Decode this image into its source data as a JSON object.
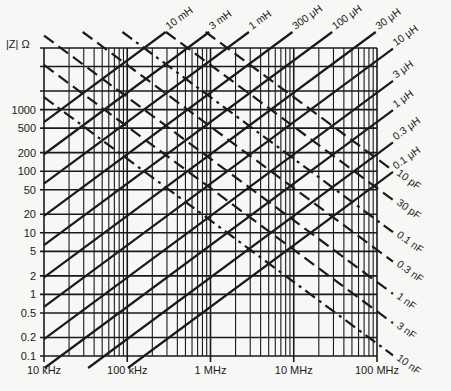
{
  "chart_data": {
    "type": "line",
    "title": "",
    "xlabel": "",
    "ylabel": "|Z| Ω",
    "xscale": "log",
    "yscale": "log",
    "xlim_hz": [
      10000,
      100000000
    ],
    "ylim_ohm": [
      0.1,
      10000
    ],
    "grid": true,
    "x_ticks": [
      {
        "value": 10000,
        "label": "10 kHz"
      },
      {
        "value": 100000,
        "label": "100 kHz"
      },
      {
        "value": 1000000,
        "label": "1 MHz"
      },
      {
        "value": 10000000,
        "label": "10 MHz"
      },
      {
        "value": 100000000,
        "label": "100 MHz"
      }
    ],
    "y_ticks": [
      {
        "value": 1000,
        "label": "1000"
      },
      {
        "value": 500,
        "label": "500"
      },
      {
        "value": 200,
        "label": "200"
      },
      {
        "value": 100,
        "label": "100"
      },
      {
        "value": 50,
        "label": "50"
      },
      {
        "value": 20,
        "label": "20"
      },
      {
        "value": 10,
        "label": "10"
      },
      {
        "value": 5,
        "label": "5"
      },
      {
        "value": 2,
        "label": "2"
      },
      {
        "value": 1,
        "label": "1"
      },
      {
        "value": 0.5,
        "label": "0.5"
      },
      {
        "value": 0.2,
        "label": "0.2"
      },
      {
        "value": 0.1,
        "label": "0.1"
      }
    ],
    "y_gridlines": [
      0.1,
      0.2,
      0.5,
      1,
      2,
      5,
      10,
      20,
      50,
      100,
      200,
      500,
      1000,
      2000,
      5000,
      10000
    ],
    "series": [
      {
        "name": "10 mH",
        "kind": "inductor",
        "value_h": 0.01,
        "style": "solid"
      },
      {
        "name": "3 mH",
        "kind": "inductor",
        "value_h": 0.003,
        "style": "solid"
      },
      {
        "name": "1 mH",
        "kind": "inductor",
        "value_h": 0.001,
        "style": "solid"
      },
      {
        "name": "300 μH",
        "kind": "inductor",
        "value_h": 0.0003,
        "style": "solid"
      },
      {
        "name": "100 μH",
        "kind": "inductor",
        "value_h": 0.0001,
        "style": "solid"
      },
      {
        "name": "30 μH",
        "kind": "inductor",
        "value_h": 3e-05,
        "style": "solid"
      },
      {
        "name": "10 μH",
        "kind": "inductor",
        "value_h": 1e-05,
        "style": "solid"
      },
      {
        "name": "3 μH",
        "kind": "inductor",
        "value_h": 3e-06,
        "style": "solid"
      },
      {
        "name": "1 μH",
        "kind": "inductor",
        "value_h": 1e-06,
        "style": "solid"
      },
      {
        "name": "0.3 μH",
        "kind": "inductor",
        "value_h": 3e-07,
        "style": "solid"
      },
      {
        "name": "0.1 μH",
        "kind": "inductor",
        "value_h": 1e-07,
        "style": "solid"
      },
      {
        "name": "10 pF",
        "kind": "capacitor",
        "value_f": 1e-11,
        "style": "dashed"
      },
      {
        "name": "30 pF",
        "kind": "capacitor",
        "value_f": 3e-11,
        "style": "dashed"
      },
      {
        "name": "0.1 nF",
        "kind": "capacitor",
        "value_f": 1e-10,
        "style": "dashdot"
      },
      {
        "name": "0.3 nF",
        "kind": "capacitor",
        "value_f": 3e-10,
        "style": "dashed"
      },
      {
        "name": "1 nF",
        "kind": "capacitor",
        "value_f": 1e-09,
        "style": "dashed"
      },
      {
        "name": "3 nF",
        "kind": "capacitor",
        "value_f": 3e-09,
        "style": "dashed"
      },
      {
        "name": "10 nF",
        "kind": "capacitor",
        "value_f": 1e-08,
        "style": "dashdot"
      }
    ]
  },
  "axis": {
    "y_title": "|Z| Ω"
  },
  "colors": {
    "ink": "#1a1a1a",
    "paper": "#f7f7f5"
  }
}
